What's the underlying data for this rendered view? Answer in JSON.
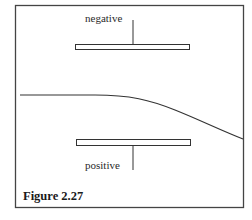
{
  "figure": {
    "caption": "Figure 2.27",
    "labels": {
      "top_plate": "negative",
      "bottom_plate": "positive"
    },
    "colors": {
      "ink": "#333333",
      "background": "#ffffff"
    }
  }
}
